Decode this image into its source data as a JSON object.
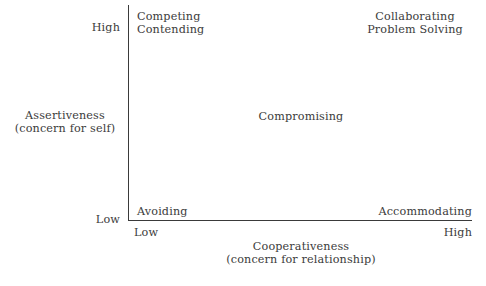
{
  "chart_data": {
    "type": "scatter",
    "title": "",
    "xlabel": "Cooperativeness",
    "xlabel_sub": "(concern for relationship)",
    "ylabel": "Assertiveness",
    "ylabel_sub": "(concern for self)",
    "xticks": [
      "Low",
      "High"
    ],
    "yticks": [
      "Low",
      "High"
    ],
    "xlim": [
      0,
      1
    ],
    "ylim": [
      0,
      1
    ],
    "grid": false,
    "legend": "none",
    "annotations": [
      {
        "name": "competing",
        "label": "Competing\nContending",
        "x": 0.05,
        "y": 0.97,
        "align": "left"
      },
      {
        "name": "collaborating",
        "label": "Collaborating\nProblem Solving",
        "x": 0.9,
        "y": 0.97,
        "align": "center"
      },
      {
        "name": "compromising",
        "label": "Compromising",
        "x": 0.5,
        "y": 0.5,
        "align": "center"
      },
      {
        "name": "avoiding",
        "label": "Avoiding",
        "x": 0.05,
        "y": 0.07,
        "align": "left"
      },
      {
        "name": "accommodating",
        "label": "Accommodating",
        "x": 0.95,
        "y": 0.07,
        "align": "right"
      }
    ]
  },
  "axes": {
    "y": {
      "title": "Assertiveness",
      "subtitle": "(concern for self)",
      "tick_high": "High",
      "tick_low": "Low"
    },
    "x": {
      "title": "Cooperativeness",
      "subtitle": "(concern for relationship)",
      "tick_low": "Low",
      "tick_high": "High"
    }
  },
  "modes": {
    "competing_line1": "Competing",
    "competing_line2": "Contending",
    "collaborating_line1": "Collaborating",
    "collaborating_line2": "Problem Solving",
    "compromising": "Compromising",
    "avoiding": "Avoiding",
    "accommodating": "Accommodating"
  },
  "colors": {
    "background": "#ffffff",
    "text": "#3b3b3b",
    "axis": "#3a3a3a"
  }
}
